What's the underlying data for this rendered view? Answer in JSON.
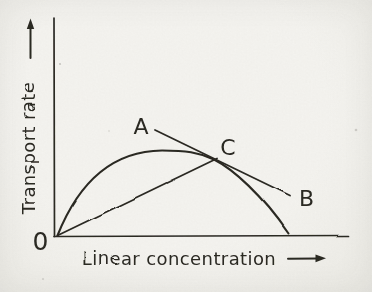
{
  "figure": {
    "kind": "scanned hand-drawn scientific figure",
    "paper_color": "#f4f3ee",
    "ink_color": "#2b2924"
  },
  "chart_data": {
    "type": "line",
    "title": "",
    "xlabel": "Linear concentration",
    "ylabel": "Transport rate",
    "origin_label": "0",
    "axes_unlabeled": true,
    "grid": false,
    "legend": false,
    "x_range_norm": [
      0,
      1
    ],
    "y_range_norm": [
      0,
      1
    ],
    "series": [
      {
        "name": "transport-rate curve (rises from origin, peaks, falls back to x-axis)",
        "style": "smooth curve",
        "points_norm": [
          [
            0.0,
            0.01
          ],
          [
            0.03,
            0.1
          ],
          [
            0.06,
            0.17
          ],
          [
            0.14,
            0.29
          ],
          [
            0.24,
            0.37
          ],
          [
            0.36,
            0.4
          ],
          [
            0.46,
            0.39
          ],
          [
            0.54,
            0.36
          ],
          [
            0.65,
            0.23
          ],
          [
            0.72,
            0.14
          ],
          [
            0.79,
            0.02
          ]
        ]
      },
      {
        "name": "straight chord from origin 0 to point C",
        "style": "straight line",
        "points_norm": [
          [
            0.0,
            0.01
          ],
          [
            0.55,
            0.36
          ]
        ]
      },
      {
        "name": "tangent line through C from A to B",
        "style": "straight line",
        "points_norm": [
          [
            0.34,
            0.49
          ],
          [
            0.8,
            0.19
          ]
        ]
      }
    ],
    "annotations": [
      {
        "text": "A",
        "position_norm": [
          0.29,
          0.51
        ],
        "meaning": "upper-left end of tangent line"
      },
      {
        "text": "C",
        "position_norm": [
          0.59,
          0.42
        ],
        "meaning": "tangency point where chord, tangent and curve meet"
      },
      {
        "text": "B",
        "position_norm": [
          0.85,
          0.19
        ],
        "meaning": "lower-right end of tangent line"
      }
    ]
  },
  "geometry": {
    "canvas": {
      "width": 372,
      "height": 292
    },
    "y_axis": {
      "x1": 54,
      "y1": 18,
      "x2": 54.5,
      "y2": 236.5
    },
    "x_axis": {
      "x1": 54,
      "y1": 236.5,
      "x2": 348.5,
      "y2": 235.5
    },
    "curve_bezier": [
      [
        57.5,
        235.5
      ],
      [
        78,
        184
      ],
      [
        110,
        151
      ],
      [
        162,
        150.5
      ],
      [
        186,
        150.5
      ],
      [
        198,
        152
      ],
      [
        214,
        159.5
      ],
      [
        233,
        169
      ],
      [
        262,
        195
      ],
      [
        288.5,
        233.5
      ]
    ],
    "chord": {
      "x1": 57.5,
      "y1": 235.5,
      "x2": 217,
      "y2": 158.5
    },
    "tangent": {
      "x1": 155,
      "y1": 130,
      "x2": 290,
      "y2": 195.5
    },
    "y_label_arrow": {
      "x1": 30.5,
      "y1": 58,
      "x2": 30.5,
      "y2": 27,
      "head": [
        [
          30.5,
          18.5
        ],
        [
          26.8,
          29
        ],
        [
          34.2,
          29
        ]
      ]
    },
    "x_label_arrow": {
      "x1": 288,
      "y1": 258.8,
      "x2": 317,
      "y2": 258.4,
      "head": [
        [
          326,
          258.2
        ],
        [
          315.5,
          254.6
        ],
        [
          315.5,
          262.2
        ]
      ]
    },
    "labels": {
      "ylabel": {
        "x": 34.5,
        "y": 148,
        "size": 18,
        "rotate": -90,
        "spacing": 0.4
      },
      "xlabel": {
        "x": 179,
        "y": 265,
        "size": 18,
        "spacing": 0.4
      },
      "origin": {
        "x": 40.5,
        "y": 250,
        "size": 25
      },
      "A": {
        "x": 141,
        "y": 134,
        "size": 22
      },
      "C": {
        "x": 228,
        "y": 155,
        "size": 22
      },
      "B": {
        "x": 306.5,
        "y": 206,
        "size": 22
      }
    },
    "specks": [
      {
        "x": 356,
        "y": 130,
        "r": 1.3,
        "o": 0.18
      },
      {
        "x": 60,
        "y": 64,
        "r": 1.1,
        "o": 0.22
      },
      {
        "x": 43,
        "y": 279,
        "r": 1.0,
        "o": 0.15
      },
      {
        "x": 109,
        "y": 131,
        "r": 0.9,
        "o": 0.12
      }
    ],
    "stroke_widths": {
      "axis": 1.7,
      "curve": 2.1,
      "line": 1.8,
      "arrow": 2.0
    }
  }
}
